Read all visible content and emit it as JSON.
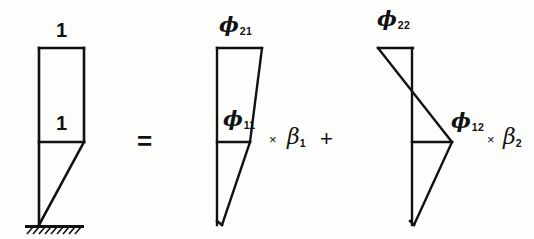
{
  "figure": {
    "type": "engineering-diagram",
    "background_color": "#fdfdfb",
    "line_color": "#111111",
    "equation_text": "1 / 1 diagram = phi21 / phi11 x beta1 + phi22 / phi12 x beta2"
  },
  "operators": {
    "equals": "=",
    "times": "×",
    "plus": "+"
  },
  "panels": [
    {
      "id": "target-shape",
      "name": "cantilever-unit-load-diagram",
      "labels": [
        {
          "id": "top-unit",
          "text": "1",
          "kind": "number",
          "x": 58,
          "y": 22
        },
        {
          "id": "mid-unit",
          "text": "1",
          "kind": "number",
          "x": 58,
          "y": 115
        }
      ],
      "has_support": true,
      "support_type": "fixed-base-hatched"
    },
    {
      "id": "mode-1-term",
      "name": "first-mode-contribution",
      "labels": [
        {
          "id": "phi21",
          "base": "ϕ",
          "sub": "21",
          "kind": "phi",
          "x": 220,
          "y": 16
        },
        {
          "id": "phi11",
          "base": "ϕ",
          "sub": "11",
          "kind": "phi",
          "x": 224,
          "y": 110
        }
      ],
      "multiplier": {
        "symbol": "β",
        "sub": "1",
        "operator": "×"
      },
      "trailing_operator": "+"
    },
    {
      "id": "mode-2-term",
      "name": "second-mode-contribution",
      "labels": [
        {
          "id": "phi22",
          "base": "ϕ",
          "sub": "22",
          "kind": "phi",
          "x": 378,
          "y": 10
        },
        {
          "id": "phi12",
          "base": "ϕ",
          "sub": "12",
          "kind": "phi",
          "x": 452,
          "y": 112
        }
      ],
      "multiplier": {
        "symbol": "β",
        "sub": "2",
        "operator": "×"
      },
      "trailing_operator": ""
    }
  ],
  "geometry": {
    "baseline_y": 225,
    "top_y": 48,
    "mid_y": 142,
    "panel1": {
      "axis_x": 39,
      "rect_right_x": 84,
      "triangle_tip_x": 39,
      "support_x1": 25,
      "support_x2": 84
    },
    "panel2": {
      "axis_x": 217,
      "top_right_x": 262,
      "mid_right_x": 250,
      "tip_x": 222
    },
    "panel3": {
      "axis_x": 412,
      "top_left_x": 378,
      "top_right_x": 413,
      "mid_right_x": 452,
      "tip_x": 412,
      "cross_y": 93
    }
  }
}
